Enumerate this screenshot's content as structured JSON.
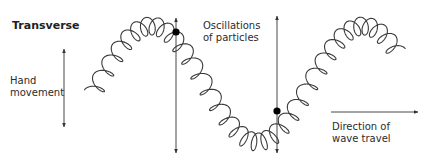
{
  "diagram": {
    "title": "Transverse",
    "labels": {
      "hand_movement_line1": "Hand",
      "hand_movement_line2": "movement",
      "oscillations_line1": "Oscillations",
      "oscillations_line2": "of particles",
      "direction_line1": "Direction of",
      "direction_line2": "wave travel"
    },
    "colors": {
      "stroke": "#3a3a3a",
      "text": "#2b2b2b",
      "particle": "#000000"
    },
    "particles_marked": 2
  }
}
